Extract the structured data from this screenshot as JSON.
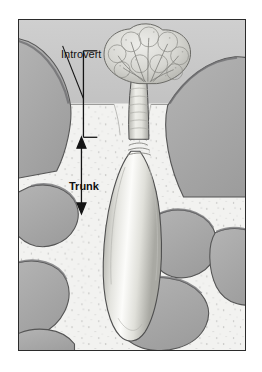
{
  "figure": {
    "type": "scientific-illustration",
    "labels": [
      {
        "id": "introvert",
        "text": "Introvert",
        "annotation": "bracket",
        "x": 42,
        "y": 29
      },
      {
        "id": "trunk",
        "text": "Trunk",
        "annotation": "double-headed-arrow",
        "x": 50,
        "y": 161
      }
    ],
    "annotations": {
      "introvert_bracket": {
        "x": 83,
        "y_top": 50,
        "y_bottom": 137,
        "tick_length": 14
      },
      "trunk_arrow": {
        "x": 81,
        "y_top": 138,
        "y_bottom": 206
      },
      "leader_line": {
        "x1": 62,
        "y1": 45,
        "x2": 83,
        "y2": 98
      }
    },
    "colors": {
      "frame_border": "#2b2b2b",
      "water": "#c9c9c9",
      "sediment": "#f2f2f0",
      "rock_fill": "#a8a8a8",
      "rock_outline": "#4a4a4a",
      "body_light": "#fbfbf8",
      "body_mid": "#d2d2cc",
      "body_outline": "#4f4f4f",
      "label_text": "#111111",
      "sediment_line": "#8f8f8f",
      "speckle": "#8a8a88"
    },
    "regions": [
      {
        "name": "water-column",
        "position": "above-sediment-surface"
      },
      {
        "name": "sediment-bed",
        "position": "below-sediment-surface"
      },
      {
        "name": "sediment-surface-line",
        "y": 103
      }
    ],
    "organism_parts": [
      {
        "name": "tentacle-crown",
        "description": "branched lobed feeding crown above sediment"
      },
      {
        "name": "introvert-neck",
        "description": "narrow ringed retractable anterior section"
      },
      {
        "name": "ring-bands",
        "description": "transverse annulations at trunk junction"
      },
      {
        "name": "trunk-body",
        "description": "elongate bulbous sac-like posterior body"
      }
    ]
  }
}
